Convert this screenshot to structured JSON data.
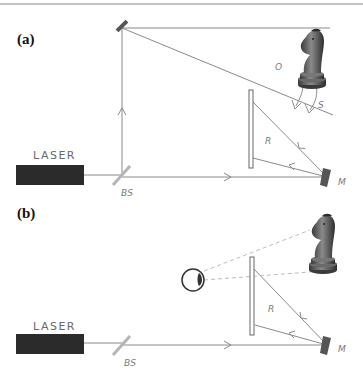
{
  "figure": {
    "top_rule": true,
    "colors": {
      "beam": "#8a8a8a",
      "laser_body": "#2b2b2b",
      "mirror": "#555555",
      "beam_splitter": "#b5b5b5",
      "plate": "#ffffff",
      "plate_stroke": "#666666",
      "dashed": "#bdbdbd",
      "label": "#7a7a7a"
    },
    "panel_a": {
      "label": "(a)",
      "laser_label": "LASER",
      "beam_splitter_label": "BS",
      "mirror_label": "M",
      "object_beam_label": "O",
      "reference_beam_label": "R",
      "scattered_label": "S",
      "object_icon": "chess-knight-icon"
    },
    "panel_b": {
      "label": "(b)",
      "laser_label": "LASER",
      "beam_splitter_label": "BS",
      "mirror_label": "M",
      "reference_beam_label": "R",
      "viewer_icon": "eye-icon",
      "virtual_image_icon": "chess-knight-icon"
    }
  }
}
